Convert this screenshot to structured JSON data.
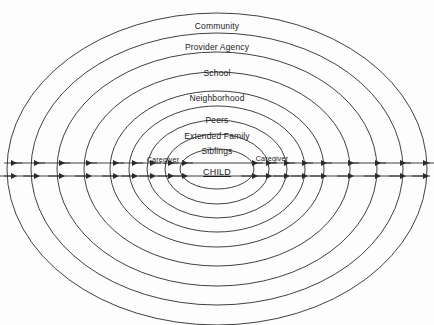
{
  "diagram": {
    "type": "concentric-ellipse-nested-diagram",
    "canvas": {
      "width": 434,
      "height": 325
    },
    "center": {
      "x": 217,
      "y": 169
    },
    "stroke_color": "#2b2b2b",
    "text_color": "#1b1b1b",
    "background_color": "#fdfdfd",
    "rings": [
      {
        "id": "community",
        "label": "Community",
        "rx": 210,
        "ry": 156,
        "label_x": 217,
        "label_y": 26
      },
      {
        "id": "provider-agency",
        "label": "Provider Agency",
        "rx": 186,
        "ry": 136,
        "label_x": 217,
        "label_y": 47
      },
      {
        "id": "school",
        "label": "School",
        "rx": 160,
        "ry": 117,
        "label_x": 217,
        "label_y": 73
      },
      {
        "id": "neighborhood",
        "label": "Neighborhood",
        "rx": 133,
        "ry": 97,
        "label_x": 217,
        "label_y": 98
      },
      {
        "id": "peers",
        "label": "Peers",
        "rx": 107,
        "ry": 78,
        "label_x": 217,
        "label_y": 120
      },
      {
        "id": "extended-family",
        "label": "Extended Family",
        "rx": 88,
        "ry": 63,
        "label_x": 217,
        "label_y": 136
      },
      {
        "id": "siblings",
        "label": "Siblings",
        "rx": 70,
        "ry": 49,
        "label_x": 217,
        "label_y": 151
      },
      {
        "id": "caregiver",
        "label": "Caregiver",
        "rx": 52,
        "ry": 35,
        "label_x": 217,
        "label_y": 160
      },
      {
        "id": "child",
        "label": "CHILD",
        "rx": 37,
        "ry": 20,
        "label_x": 217,
        "label_y": 172
      }
    ],
    "caregiver_labels": [
      {
        "id": "caregiver-left",
        "label": "Caregiver",
        "x": 163,
        "y": 159
      },
      {
        "id": "caregiver-right",
        "label": "Caregiver",
        "x": 272,
        "y": 158
      }
    ],
    "child_label": {
      "label": "CHILD",
      "x": 217,
      "y": 172,
      "underline": true
    },
    "axes": {
      "inward_arrow_line": {
        "id": "inward-influence-axis",
        "y": 163,
        "x_start": 4,
        "x_end": 430,
        "direction": "left",
        "description": "upper horizontal axis with arrowheads pointing left"
      },
      "outward_arrow_line": {
        "id": "outward-influence-axis",
        "y": 176,
        "x_start": 4,
        "x_end": 430,
        "direction": "right",
        "description": "lower horizontal axis with arrowheads pointing right"
      },
      "crossings_left": [
        11,
        34,
        59,
        86,
        113,
        132,
        150,
        168,
        182
      ],
      "crossings_right": [
        423,
        400,
        375,
        348,
        321,
        302,
        284,
        266,
        252
      ]
    }
  }
}
